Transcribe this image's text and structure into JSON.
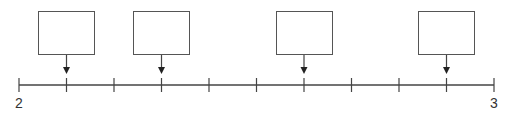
{
  "diagram": {
    "type": "number-line",
    "start_label": "2",
    "end_label": "3",
    "start_value": 2,
    "end_value": 3,
    "divisions": 10,
    "tick_values": [
      2.0,
      2.1,
      2.2,
      2.3,
      2.4,
      2.5,
      2.6,
      2.7,
      2.8,
      2.9,
      3.0
    ],
    "boxes": [
      {
        "points_to_value": 2.1,
        "content": ""
      },
      {
        "points_to_value": 2.3,
        "content": ""
      },
      {
        "points_to_value": 2.6,
        "content": ""
      },
      {
        "points_to_value": 2.9,
        "content": ""
      }
    ],
    "colors": {
      "line": "#444444",
      "box_border": "#555555",
      "text": "#333333"
    }
  }
}
